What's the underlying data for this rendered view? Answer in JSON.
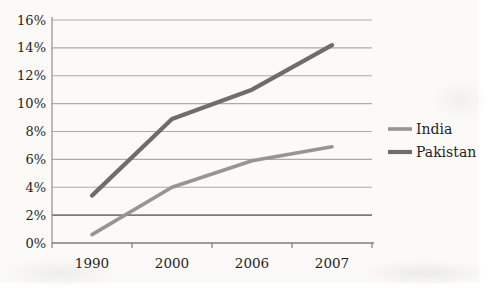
{
  "chart_data": {
    "type": "line",
    "categories": [
      "1990",
      "2000",
      "2006",
      "2007"
    ],
    "series": [
      {
        "name": "India",
        "values": [
          0.6,
          4.0,
          5.9,
          6.9
        ],
        "color": "#959595",
        "stroke_width": 3.6
      },
      {
        "name": "Pakistan",
        "values": [
          3.4,
          8.9,
          11.0,
          14.2
        ],
        "color": "#6d6d6d",
        "stroke_width": 4.2
      }
    ],
    "title": "",
    "xlabel": "",
    "ylabel": "",
    "ylim": [
      0,
      16
    ],
    "ytick_step": 2,
    "ytick_suffix": "%",
    "grid": true,
    "emphasized_gridline_value": 2,
    "legend_position": "right"
  },
  "colors": {
    "background": "#fbfaf6",
    "gridline": "#ababab",
    "gridline_emphasis": "#7a7a7a",
    "axis": "#8f8f8f",
    "text": "#1f1f1f"
  }
}
